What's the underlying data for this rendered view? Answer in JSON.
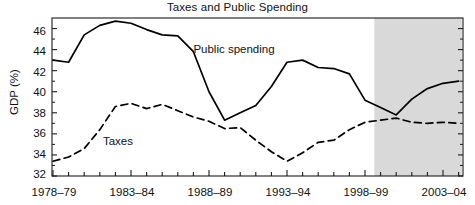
{
  "chart_data": {
    "type": "line",
    "title": "Taxes and Public Spending",
    "xlabel": "",
    "ylabel": "GDP (%)",
    "ylim": [
      32,
      47
    ],
    "yticks": [
      32,
      34,
      36,
      38,
      40,
      42,
      44,
      46
    ],
    "ytick_labels": [
      "32",
      "34",
      "36",
      "38",
      "40",
      "42",
      "44",
      "46"
    ],
    "grid": false,
    "legend_position": "inline-annotation",
    "x": [
      "1978-79",
      "1979-80",
      "1980-81",
      "1981-82",
      "1982-83",
      "1983-84",
      "1984-85",
      "1985-86",
      "1986-87",
      "1987-88",
      "1988-89",
      "1989-90",
      "1990-91",
      "1991-92",
      "1992-93",
      "1993-94",
      "1994-95",
      "1995-96",
      "1996-97",
      "1997-98",
      "1998-99",
      "1999-00",
      "2000-01",
      "2001-02",
      "2002-03",
      "2003-04",
      "2004-05"
    ],
    "xtick_labels": [
      "1978–79",
      "1983–84",
      "1988–89",
      "1993–94",
      "1998–99",
      "2003–04"
    ],
    "xtick_positions": [
      0,
      5,
      10,
      15,
      20,
      25
    ],
    "series": [
      {
        "name": "Public spending",
        "style": "solid",
        "color": "#000000",
        "values": [
          43.0,
          42.8,
          45.4,
          46.3,
          46.7,
          46.5,
          45.9,
          45.4,
          45.3,
          43.8,
          40.0,
          37.3,
          38.0,
          38.7,
          40.5,
          42.8,
          43.0,
          42.3,
          42.2,
          41.7,
          39.2,
          38.5,
          37.8,
          39.3,
          40.3,
          40.8,
          41.0
        ]
      },
      {
        "name": "Taxes",
        "style": "dashed",
        "color": "#000000",
        "values": [
          33.4,
          33.8,
          34.6,
          36.4,
          38.6,
          38.9,
          38.4,
          38.8,
          38.2,
          37.6,
          37.2,
          36.5,
          36.6,
          35.4,
          34.3,
          33.4,
          34.2,
          35.2,
          35.4,
          36.4,
          37.1,
          37.3,
          37.5,
          37.1,
          37.0,
          37.1,
          37.0
        ]
      }
    ],
    "annotations": [
      {
        "name": "public-spending-label",
        "text": "Public spending",
        "x_index": 9.0,
        "y_value": 44.0
      },
      {
        "name": "taxes-label",
        "text": "Taxes",
        "x_index": 3.2,
        "y_value": 35.2
      }
    ],
    "shaded_region": {
      "label": "Projections",
      "start_x_index": 20.6,
      "end_x_index": 26.2,
      "color": "#d9d9d9"
    }
  }
}
